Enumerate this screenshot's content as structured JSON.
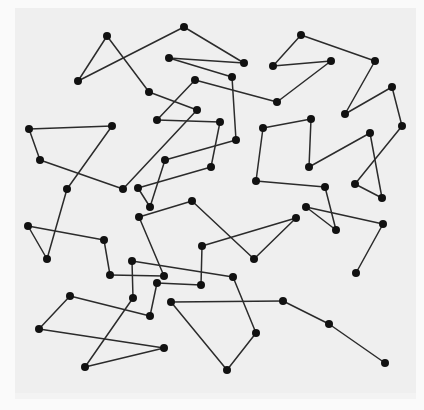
{
  "diagram": {
    "type": "undirected-graph",
    "colors": {
      "background": "#fafafa",
      "panel": "#efefef",
      "edge": "#2b2b2b",
      "node": "#111111"
    },
    "node_radius": 4,
    "nodes": {
      "A": [
        107,
        36
      ],
      "B": [
        78,
        81
      ],
      "C": [
        184,
        27
      ],
      "D": [
        169,
        58
      ],
      "E": [
        149,
        92
      ],
      "F": [
        195,
        80
      ],
      "G": [
        197,
        110
      ],
      "H": [
        157,
        120
      ],
      "J": [
        244,
        63
      ],
      "K": [
        232,
        77
      ],
      "L": [
        277,
        102
      ],
      "M": [
        273,
        66
      ],
      "N": [
        301,
        35
      ],
      "R": [
        331,
        61
      ],
      "S": [
        375,
        61
      ],
      "T": [
        345,
        114
      ],
      "U": [
        392,
        87
      ],
      "V": [
        402,
        126
      ],
      "W": [
        370,
        133
      ],
      "X": [
        311,
        119
      ],
      "Y": [
        263,
        128
      ],
      "Z": [
        309,
        167
      ],
      "AA": [
        256,
        181
      ],
      "AB": [
        325,
        187
      ],
      "AC": [
        355,
        184
      ],
      "AD": [
        382,
        198
      ],
      "AE": [
        29,
        129
      ],
      "AF": [
        112,
        126
      ],
      "AG": [
        40,
        160
      ],
      "AH": [
        67,
        189
      ],
      "AI": [
        123,
        189
      ],
      "AJ": [
        138,
        188
      ],
      "AK": [
        150,
        207
      ],
      "AL": [
        139,
        217
      ],
      "AM": [
        28,
        226
      ],
      "AN": [
        104,
        240
      ],
      "AO": [
        47,
        259
      ],
      "AQ": [
        165,
        160
      ],
      "AR": [
        220,
        122
      ],
      "AS": [
        236,
        140
      ],
      "AT": [
        211,
        167
      ],
      "AU": [
        192,
        201
      ],
      "AV": [
        202,
        246
      ],
      "AW": [
        254,
        259
      ],
      "BA": [
        306,
        207
      ],
      "BB": [
        336,
        230
      ],
      "BC": [
        296,
        218
      ],
      "BD": [
        383,
        224
      ],
      "BE": [
        356,
        273
      ],
      "BF": [
        132,
        261
      ],
      "BG": [
        110,
        275
      ],
      "BH": [
        164,
        276
      ],
      "BI": [
        157,
        283
      ],
      "BJ": [
        201,
        285
      ],
      "BK": [
        233,
        277
      ],
      "BL": [
        133,
        298
      ],
      "BM": [
        150,
        316
      ],
      "BN": [
        171,
        302
      ],
      "BO": [
        256,
        333
      ],
      "BP": [
        70,
        296
      ],
      "BQ": [
        39,
        329
      ],
      "BR": [
        164,
        348
      ],
      "BS": [
        85,
        367
      ],
      "BT": [
        283,
        301
      ],
      "BU": [
        329,
        324
      ],
      "BV": [
        385,
        363
      ],
      "BW": [
        227,
        370
      ]
    },
    "edges": [
      [
        "A",
        "B"
      ],
      [
        "B",
        "C"
      ],
      [
        "A",
        "E"
      ],
      [
        "C",
        "J"
      ],
      [
        "D",
        "J"
      ],
      [
        "D",
        "K"
      ],
      [
        "K",
        "AS"
      ],
      [
        "E",
        "G"
      ],
      [
        "F",
        "H"
      ],
      [
        "F",
        "L"
      ],
      [
        "H",
        "AR"
      ],
      [
        "AR",
        "AT"
      ],
      [
        "G",
        "AI"
      ],
      [
        "L",
        "R"
      ],
      [
        "R",
        "M"
      ],
      [
        "M",
        "N"
      ],
      [
        "N",
        "S"
      ],
      [
        "S",
        "T"
      ],
      [
        "T",
        "U"
      ],
      [
        "U",
        "V"
      ],
      [
        "V",
        "AC"
      ],
      [
        "AC",
        "AD"
      ],
      [
        "AD",
        "W"
      ],
      [
        "W",
        "Z"
      ],
      [
        "Z",
        "X"
      ],
      [
        "X",
        "Y"
      ],
      [
        "Y",
        "AA"
      ],
      [
        "AA",
        "AB"
      ],
      [
        "AB",
        "BB"
      ],
      [
        "BB",
        "BA"
      ],
      [
        "BA",
        "BD"
      ],
      [
        "BD",
        "BE"
      ],
      [
        "AE",
        "AF"
      ],
      [
        "AE",
        "AG"
      ],
      [
        "AG",
        "AI"
      ],
      [
        "AF",
        "AH"
      ],
      [
        "AH",
        "AO"
      ],
      [
        "AO",
        "AM"
      ],
      [
        "AM",
        "AN"
      ],
      [
        "AN",
        "BG"
      ],
      [
        "BG",
        "BH"
      ],
      [
        "AJ",
        "AT"
      ],
      [
        "AJ",
        "AK"
      ],
      [
        "AK",
        "AQ"
      ],
      [
        "AQ",
        "AS"
      ],
      [
        "AL",
        "AU"
      ],
      [
        "AL",
        "BH"
      ],
      [
        "AU",
        "AW"
      ],
      [
        "AV",
        "BC"
      ],
      [
        "BC",
        "AW"
      ],
      [
        "BF",
        "BK"
      ],
      [
        "BF",
        "BL"
      ],
      [
        "BI",
        "BJ"
      ],
      [
        "BJ",
        "AV"
      ],
      [
        "BI",
        "BM"
      ],
      [
        "BL",
        "BS"
      ],
      [
        "BP",
        "BM"
      ],
      [
        "BP",
        "BQ"
      ],
      [
        "BQ",
        "BR"
      ],
      [
        "BR",
        "BS"
      ],
      [
        "BN",
        "BT"
      ],
      [
        "BT",
        "BU"
      ],
      [
        "BU",
        "BV"
      ],
      [
        "BN",
        "BW"
      ],
      [
        "BW",
        "BO"
      ],
      [
        "BO",
        "BK"
      ]
    ]
  }
}
